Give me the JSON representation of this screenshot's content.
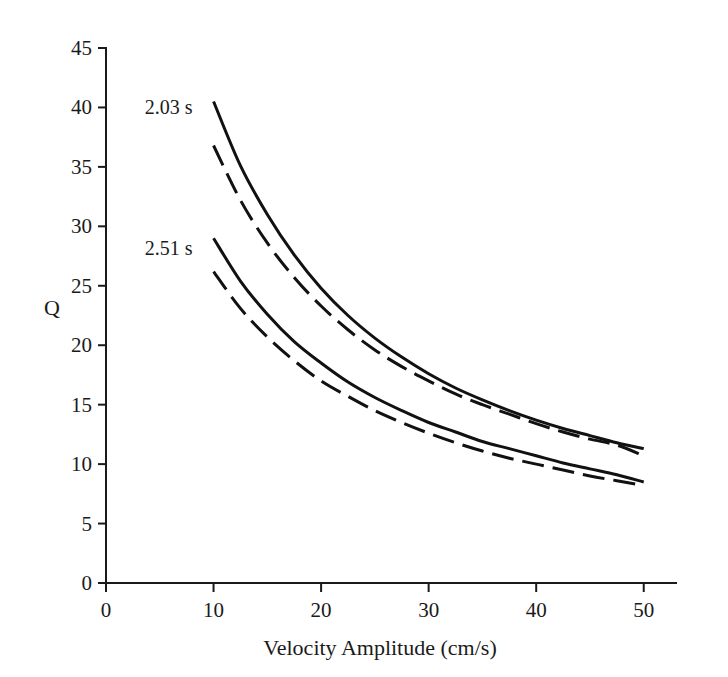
{
  "chart_data": {
    "type": "line",
    "title": "",
    "xlabel": "Velocity Amplitude (cm/s)",
    "ylabel": "Q",
    "xlim": [
      0,
      53
    ],
    "ylim": [
      0,
      45
    ],
    "xticks": [
      0,
      10,
      20,
      30,
      40,
      50
    ],
    "xtick_labels": [
      "0",
      "10",
      "20",
      "30",
      "40",
      "50"
    ],
    "yticks": [
      0,
      5,
      10,
      15,
      20,
      25,
      30,
      35,
      40,
      45
    ],
    "ytick_labels": [
      "0",
      "5",
      "10",
      "15",
      "20",
      "25",
      "30",
      "35",
      "40",
      "45"
    ],
    "grid": false,
    "legend": "annotations-inline",
    "annotations": [
      {
        "text": "2.03 s",
        "x": 3.6,
        "y": 40.0
      },
      {
        "text": "2.51 s",
        "x": 3.6,
        "y": 28.2
      }
    ],
    "x": [
      10,
      12.5,
      15,
      17.5,
      20,
      22.5,
      25,
      27.5,
      30,
      32.5,
      35,
      37.5,
      40,
      42.5,
      45,
      47.5,
      50
    ],
    "series": [
      {
        "name": "2.03 s solid",
        "style": "solid",
        "values": [
          40.5,
          35.1,
          31.0,
          27.6,
          24.8,
          22.5,
          20.6,
          19.0,
          17.6,
          16.4,
          15.4,
          14.5,
          13.7,
          13.0,
          12.4,
          11.8,
          11.3
        ]
      },
      {
        "name": "2.03 s dashed",
        "style": "dashed",
        "values": [
          36.8,
          32.2,
          28.6,
          25.7,
          23.3,
          21.3,
          19.6,
          18.2,
          17.0,
          15.9,
          15.0,
          14.2,
          13.4,
          12.7,
          12.1,
          11.6,
          10.7
        ]
      },
      {
        "name": "2.51 s solid",
        "style": "solid",
        "values": [
          29.0,
          25.4,
          22.6,
          20.3,
          18.5,
          16.9,
          15.6,
          14.5,
          13.5,
          12.7,
          11.9,
          11.3,
          10.7,
          10.1,
          9.6,
          9.1,
          8.5
        ]
      },
      {
        "name": "2.51 s dashed",
        "style": "dashed",
        "values": [
          26.2,
          23.1,
          20.7,
          18.7,
          17.0,
          15.7,
          14.5,
          13.5,
          12.6,
          11.8,
          11.1,
          10.5,
          10.0,
          9.5,
          9.0,
          8.6,
          8.2
        ]
      }
    ],
    "colors": {
      "axis": "#1a1a1a",
      "curve": "#111111",
      "background": "#ffffff"
    }
  }
}
